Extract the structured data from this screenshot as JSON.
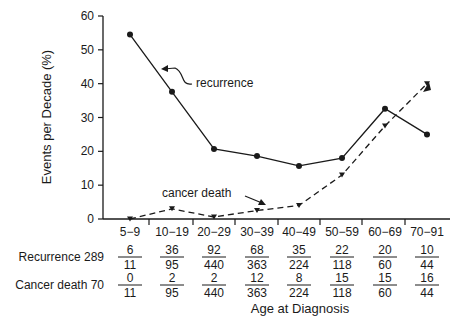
{
  "chart_data": {
    "type": "line",
    "title": "",
    "xlabel": "Age at Diagnosis",
    "ylabel": "Events per Decade (%)",
    "ylim": [
      0,
      60
    ],
    "yticks": [
      0,
      10,
      20,
      30,
      40,
      50,
      60
    ],
    "categories": [
      "5-9",
      "10-19",
      "20-29",
      "30-39",
      "40-49",
      "50-59",
      "60-69",
      "70-91"
    ],
    "series": [
      {
        "name": "recurrence",
        "style": "solid",
        "marker": "circle",
        "values": [
          54.5,
          37.6,
          20.7,
          18.6,
          15.7,
          18.0,
          32.6,
          25.0
        ]
      },
      {
        "name": "cancer death",
        "style": "dashed",
        "marker": "triangle",
        "values": [
          0,
          3.0,
          0.6,
          2.5,
          4.0,
          13.0,
          27.5,
          40.0
        ]
      }
    ],
    "annotations": [
      "recurrence",
      "cancer death"
    ],
    "grid": false,
    "legend": "inline annotations with arrows",
    "table": {
      "rows": [
        {
          "label": "Recurrence 289",
          "fractions": [
            [
              "6",
              "11"
            ],
            [
              "36",
              "95"
            ],
            [
              "92",
              "440"
            ],
            [
              "68",
              "363"
            ],
            [
              "35",
              "224"
            ],
            [
              "22",
              "118"
            ],
            [
              "20",
              "60"
            ],
            [
              "10",
              "44"
            ]
          ]
        },
        {
          "label": "Cancer death 70",
          "fractions": [
            [
              "0",
              "11"
            ],
            [
              "2",
              "95"
            ],
            [
              "2",
              "440"
            ],
            [
              "12",
              "363"
            ],
            [
              "8",
              "224"
            ],
            [
              "15",
              "118"
            ],
            [
              "15",
              "60"
            ],
            [
              "16",
              "44"
            ]
          ]
        }
      ]
    }
  }
}
